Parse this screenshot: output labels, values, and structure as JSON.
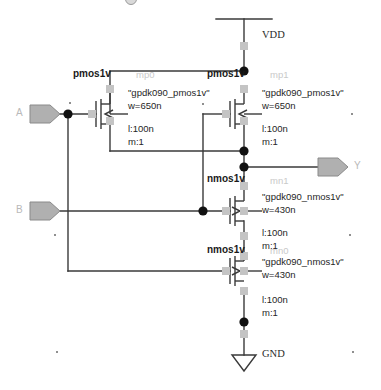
{
  "schematic": {
    "title": "CMOS 2-input gate schematic",
    "supplies": [
      {
        "name": "VDD",
        "label": "VDD"
      },
      {
        "name": "GND",
        "label": "GND"
      }
    ],
    "pins": [
      {
        "name": "A",
        "label": "A",
        "direction": "input"
      },
      {
        "name": "B",
        "label": "B",
        "direction": "input"
      },
      {
        "name": "Y",
        "label": "Y",
        "direction": "output"
      }
    ],
    "devices": [
      {
        "instance": "mp0",
        "type_label": "pmos1v",
        "model": "\"gpdk090_pmos1v\"",
        "w": "w=650n",
        "l": "l:100n",
        "m": "m:1"
      },
      {
        "instance": "mp1",
        "type_label": "pmos1v",
        "model": "\"gpdk090_pmos1v\"",
        "w": "w=650n",
        "l": "l:100n",
        "m": "m:1"
      },
      {
        "instance": "mn1",
        "type_label": "nmos1v",
        "model": "\"gpdk090_nmos1v\"",
        "w": "w=430n",
        "l": "l:100n",
        "m": "m:1"
      },
      {
        "instance": "mn0",
        "type_label": "nmos1v",
        "model": "\"gpdk090_nmos1v\"",
        "w": "w=430n",
        "l": "l:100n",
        "m": "m:1"
      }
    ],
    "colors": {
      "wire": "#3a3a3a",
      "device": "#4a4a4a",
      "pin_fill": "#b0b0b0",
      "pin_stroke": "#8a8a8a",
      "pad": "#c4c4c4",
      "junction": "#111111",
      "faint_text": "#c9c9c9"
    }
  }
}
